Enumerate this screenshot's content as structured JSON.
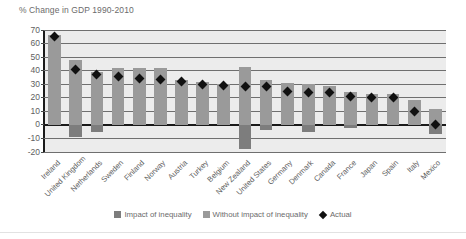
{
  "chart_data": {
    "type": "bar",
    "title": "% Change in GDP 1990-2010",
    "xlabel": "",
    "ylabel": "",
    "ylim": [
      -20,
      70
    ],
    "ytick_step": 10,
    "yticks": [
      70,
      60,
      50,
      40,
      30,
      20,
      10,
      0,
      -10,
      -20
    ],
    "grid": true,
    "legend_position": "bottom",
    "categories": [
      "Ireland",
      "United Kingdom",
      "Netherlands",
      "Sweden",
      "Finland",
      "Norway",
      "Austria",
      "Turkey",
      "Belgium",
      "New Zealand",
      "United States",
      "Germany",
      "Denmark",
      "Canada",
      "France",
      "Japan",
      "Spain",
      "Italy",
      "Mexico"
    ],
    "series": [
      {
        "name": "Without impact of inequality",
        "role": "bar-top",
        "values": [
          66,
          48,
          39,
          42,
          42,
          42,
          33,
          32,
          30,
          43,
          33,
          31,
          30,
          29,
          24,
          23,
          23,
          18,
          12
        ]
      },
      {
        "name": "Impact of inequality",
        "role": "bar-bottom",
        "values": [
          0,
          -9,
          -5,
          0,
          0,
          0,
          0,
          0,
          0,
          -18,
          -4,
          0,
          -5,
          0,
          -2,
          0,
          0,
          0,
          -7
        ]
      },
      {
        "name": "Actual",
        "role": "marker",
        "values": [
          65,
          41,
          37,
          35.5,
          34,
          33.5,
          32,
          30,
          29,
          28.5,
          28,
          25,
          24,
          24,
          21,
          20.5,
          20,
          10,
          0.5
        ]
      }
    ],
    "legend": [
      {
        "label": "Impact of inequality",
        "swatch": "square",
        "color": "#7d7d7d"
      },
      {
        "label": "Without impact of inequality",
        "swatch": "square",
        "color": "#9a9a9a"
      },
      {
        "label": "Actual",
        "swatch": "diamond",
        "color": "#111111"
      }
    ]
  },
  "colors": {
    "plot_background": "#ececec",
    "page_background": "#ffffff",
    "gridline": "#6f6f6f",
    "axis": "#1a1a1a",
    "bar_positive": "#9a9a9a",
    "bar_negative": "#7d7d7d",
    "marker": "#111111",
    "text": "#5e5e5e",
    "title_text": "#6b6b6b"
  }
}
